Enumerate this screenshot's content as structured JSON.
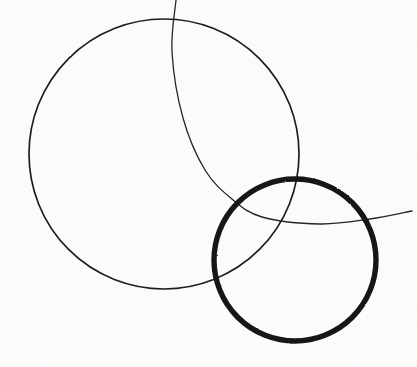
{
  "artwork": {
    "title": "Overlapping Circles Sketch",
    "medium": "ink line drawing on paper",
    "canvas": {
      "width": 417,
      "height": 367
    },
    "background_color": "#fbfbfa",
    "ink_color": "#1a1a1a",
    "shape_count": 3
  },
  "shapes": [
    {
      "id": "large-thin-circle",
      "label": "Large thin circle",
      "type": "circle",
      "center_x": 164,
      "center_y": 154,
      "radius": 135,
      "stroke_width": 1.7,
      "stroke_color": "#1d1d1d",
      "bounds": {
        "left": 29,
        "top": 19,
        "right": 299,
        "bottom": 289
      },
      "complete": true
    },
    {
      "id": "bold-circle",
      "label": "Bold thick circle",
      "type": "circle",
      "center_x": 295,
      "center_y": 260,
      "radius": 81,
      "stroke_width": 5.4,
      "stroke_color": "#171717",
      "bounds": {
        "left": 214,
        "top": 179,
        "right": 376,
        "bottom": 341
      },
      "complete": true
    },
    {
      "id": "sweeping-thin-arc",
      "label": "Sweeping thin arc",
      "type": "arc",
      "stroke_width": 1.3,
      "stroke_color": "#262626",
      "start_point": {
        "x": 176,
        "y": 0
      },
      "end_point": {
        "x": 412,
        "y": 211
      },
      "waypoints": [
        {
          "x": 176,
          "y": 0
        },
        {
          "x": 172,
          "y": 52
        },
        {
          "x": 183,
          "y": 118
        },
        {
          "x": 205,
          "y": 170
        },
        {
          "x": 232,
          "y": 199
        },
        {
          "x": 262,
          "y": 217
        },
        {
          "x": 320,
          "y": 224
        },
        {
          "x": 370,
          "y": 219
        },
        {
          "x": 412,
          "y": 211
        }
      ],
      "complete": false
    }
  ],
  "intersections": [
    {
      "id": "arc-crosses-large-circle-top",
      "x": 177,
      "y": 24
    },
    {
      "id": "arc-crosses-bold-circle-top",
      "x": 236,
      "y": 202
    },
    {
      "id": "arc-crosses-bold-circle-right",
      "x": 374,
      "y": 218
    },
    {
      "id": "large-circle-crosses-bold-circle-upper",
      "x": 290,
      "y": 186
    },
    {
      "id": "large-circle-crosses-bold-circle-lower",
      "x": 228,
      "y": 274
    }
  ]
}
